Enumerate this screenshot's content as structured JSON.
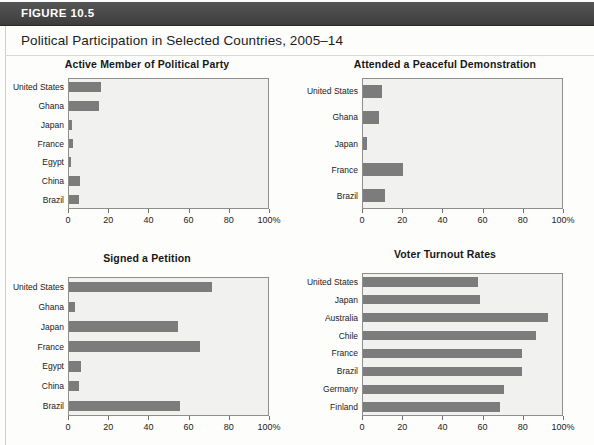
{
  "header": {
    "figure_label": "FIGURE 10.5",
    "title": "Political Participation in Selected Countries, 2005–14"
  },
  "footer": {
    "source_note": "Source note partially cut off at page edge"
  },
  "axis": {
    "tick_labels": [
      "0",
      "20",
      "40",
      "60",
      "80",
      "100%"
    ],
    "tick_values": [
      0,
      20,
      40,
      60,
      80,
      100
    ]
  },
  "colors": {
    "bar": "#7c7c7c",
    "plot_background": "#f1f1ef",
    "plot_border": "#8e8e8e",
    "banner": "#4a4a4a",
    "banner_text": "#ffffff"
  },
  "chart_data": [
    {
      "type": "bar",
      "orientation": "horizontal",
      "title": "Active Member of Political Party",
      "categories": [
        "United States",
        "Ghana",
        "Japan",
        "France",
        "Egypt",
        "China",
        "Brazil"
      ],
      "values": [
        16,
        15,
        1.5,
        2,
        1,
        5.5,
        5
      ],
      "xlabel": "",
      "ylabel": "",
      "xlim": [
        0,
        100
      ],
      "xticks": [
        0,
        20,
        40,
        60,
        80,
        100
      ],
      "xtick_labels": [
        "0",
        "20",
        "40",
        "60",
        "80",
        "100%"
      ],
      "grid": false,
      "legend": "none"
    },
    {
      "type": "bar",
      "orientation": "horizontal",
      "title": "Attended a Peaceful Demonstration",
      "categories": [
        "United States",
        "Ghana",
        "Japan",
        "France",
        "Brazil"
      ],
      "values": [
        9.5,
        8,
        2,
        20,
        11
      ],
      "xlabel": "",
      "ylabel": "",
      "xlim": [
        0,
        100
      ],
      "xticks": [
        0,
        20,
        40,
        60,
        80,
        100
      ],
      "xtick_labels": [
        "0",
        "20",
        "40",
        "60",
        "80",
        "100%"
      ],
      "grid": false,
      "legend": "none"
    },
    {
      "type": "bar",
      "orientation": "horizontal",
      "title": "Signed a Petition",
      "categories": [
        "United States",
        "Ghana",
        "Japan",
        "France",
        "Egypt",
        "China",
        "Brazil"
      ],
      "values": [
        71,
        3,
        54,
        65,
        6,
        5,
        55
      ],
      "xlabel": "",
      "ylabel": "",
      "xlim": [
        0,
        100
      ],
      "xticks": [
        0,
        20,
        40,
        60,
        80,
        100
      ],
      "xtick_labels": [
        "0",
        "20",
        "40",
        "60",
        "80",
        "100%"
      ],
      "grid": false,
      "legend": "none"
    },
    {
      "type": "bar",
      "orientation": "horizontal",
      "title": "Voter Turnout Rates",
      "categories": [
        "United States",
        "Japan",
        "Australia",
        "Chile",
        "France",
        "Brazil",
        "Germany",
        "Finland"
      ],
      "values": [
        57,
        58,
        92,
        86,
        79,
        79,
        70,
        68
      ],
      "xlabel": "",
      "ylabel": "",
      "xlim": [
        0,
        100
      ],
      "xticks": [
        0,
        20,
        40,
        60,
        80,
        100
      ],
      "xtick_labels": [
        "0",
        "20",
        "40",
        "60",
        "80",
        "100%"
      ],
      "grid": false,
      "legend": "none"
    }
  ]
}
